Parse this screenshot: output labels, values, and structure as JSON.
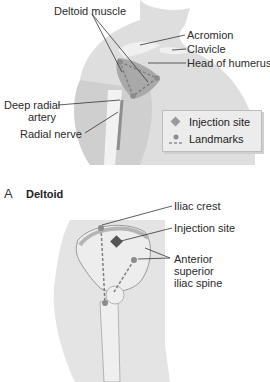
{
  "figure": {
    "panel_a": {
      "letter": "A",
      "title": "Deltoid",
      "labels": {
        "deltoid_muscle": "Deltoid muscle",
        "acromion": "Acromion",
        "clavicle": "Clavicle",
        "head_of_humerus": "Head of humerus",
        "deep_radial_artery_line1": "Deep radial",
        "deep_radial_artery_line2": "artery",
        "radial_nerve": "Radial nerve"
      },
      "legend": {
        "injection_site": "Injection site",
        "landmarks": "Landmarks"
      }
    },
    "panel_b": {
      "labels": {
        "iliac_crest": "Iliac crest",
        "injection_site": "Injection site",
        "asis_line1": "Anterior",
        "asis_line2": "superior",
        "asis_line3": "iliac spine"
      }
    },
    "colors": {
      "body_fill": "#d9d9d9",
      "bone_fill": "#ededed",
      "muscle_fill": "#a9a9a9",
      "marker": "#8c8c8c",
      "injection_marker": "#555555",
      "line": "#333333"
    }
  }
}
